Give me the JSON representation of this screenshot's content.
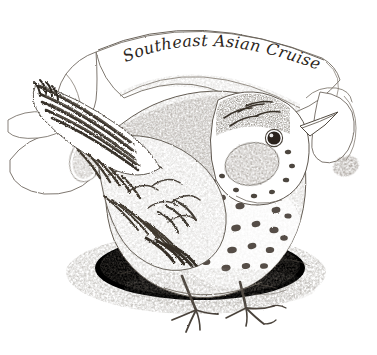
{
  "artwork": {
    "title_text": "Southeast Asian Cruise",
    "subject": "speckled thrush-like bird perched on ground",
    "medium": "pencil sketch engraving",
    "alt_description": "Pencil sketch of a speckled bird standing in front of a curled ribbon scroll banner inscribed Southeast Asian Cruise",
    "canvas": {
      "width": "377",
      "height": "355",
      "background_color": "#ffffff"
    },
    "palette": {
      "ink": "#3a332c",
      "ink_light": "#8e867c",
      "ink_faint": "#bdb6ad",
      "paper": "#ffffff",
      "shade": "#d8d3cb"
    },
    "elements": {
      "banner_label": "curled ribbon scroll banner",
      "bird_label": "speckled bird",
      "bird_eye_label": "bird eye",
      "bird_beak_label": "bird beak",
      "bird_tail_label": "bird tail feathers",
      "bird_wing_label": "bird wing",
      "bird_breast_label": "bird breast",
      "bird_feet_label": "bird feet and claws",
      "ground_label": "ground shading",
      "scroll_curl_left_label": "left scroll curl",
      "scroll_curl_right_label": "right scroll curl"
    }
  }
}
